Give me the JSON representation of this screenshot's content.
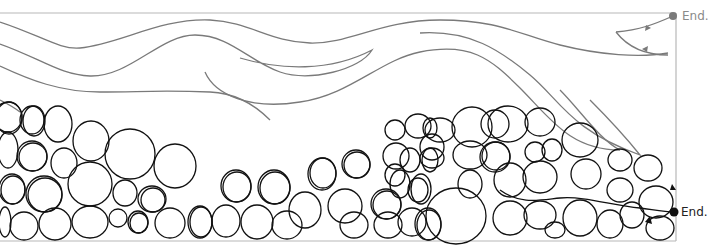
{
  "diagram": {
    "title": "",
    "panels": [
      {
        "name": "laminar-flow",
        "description": "Smooth grey streamlines flowing, ending at a grey dot with arrowheads",
        "stroke_color": "#7a7a7a",
        "end_label": "End.",
        "end_marker_color": "#7a7a7a"
      },
      {
        "name": "turbulent-flow",
        "description": "Dense black tangled loops (bubble-like eddies) ending at a black dot",
        "stroke_color": "#111111",
        "end_label": "End.",
        "end_marker_color": "#111111"
      }
    ],
    "frame_color": "#b5b5b5"
  }
}
